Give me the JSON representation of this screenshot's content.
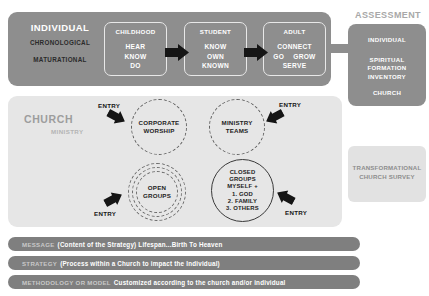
{
  "individual": {
    "title": "INDIVIDUAL",
    "subtitle_1": "CHRONOLOGICAL",
    "subtitle_2": "MATURATIONAL",
    "stages": [
      {
        "title": "CHILDHOOD",
        "line_1": "HEAR",
        "line_2": "KNOW",
        "line_3": "DO"
      },
      {
        "title": "STUDENT",
        "line_1": "KNOW",
        "line_2": "OWN",
        "line_3": "KNOWN"
      },
      {
        "title": "ADULT",
        "line_1": "CONNECT",
        "line_2a": "GO",
        "line_2b": "GROW",
        "line_3": "SERVE"
      }
    ],
    "arrow_1": "arrow-right-icon",
    "arrow_2": "arrow-right-icon"
  },
  "assessment": {
    "title": "ASSESSMENT",
    "line_1": "INDIVIDUAL",
    "line_2": "SPIRITUAL\nFORMATION\nINVENTORY",
    "line_3": "CHURCH",
    "survey": "TRANSFORMATIONAL\nCHURCH SURVEY"
  },
  "church": {
    "title": "CHURCH",
    "subtitle": "MINISTRY",
    "circles": [
      {
        "name": "corporate-worship",
        "label": "CORPORATE\nWORSHIP",
        "style": "dashed"
      },
      {
        "name": "ministry-teams",
        "label": "MINISTRY\nTEAMS",
        "style": "dashed"
      },
      {
        "name": "open-groups",
        "label": "OPEN\nGROUPS",
        "style": "dashed-multi"
      },
      {
        "name": "closed-groups",
        "label": "CLOSED\nGROUPS\nMYSELF +\n1. GOD\n2. FAMILY\n3. OTHERS",
        "style": "solid"
      }
    ],
    "entries": [
      {
        "label": "ENTRY",
        "target": "corporate-worship",
        "icon": "arrow-down-right-icon"
      },
      {
        "label": "ENTRY",
        "target": "ministry-teams",
        "icon": "arrow-down-left-icon"
      },
      {
        "label": "ENTRY",
        "target": "open-groups",
        "icon": "arrow-up-right-icon"
      },
      {
        "label": "ENTRY",
        "target": "closed-groups",
        "icon": "arrow-up-left-icon"
      }
    ]
  },
  "bars": [
    {
      "key": "MESSAGE",
      "value": "(Content of the Strategy) Lifespan...Birth To Heaven"
    },
    {
      "key": "STRATEGY",
      "value": "(Process within a Church to impact the Individual)"
    },
    {
      "key": "METHODOLOGY OR MODEL",
      "value": "Customized according to the church and/or individual"
    }
  ],
  "colors": {
    "band_gray": "#8e8e8e",
    "panel_gray": "#e6e6e6",
    "bar_gray": "#7f7f7f",
    "survey_gray": "#e2e2e2",
    "ink": "#151515"
  }
}
